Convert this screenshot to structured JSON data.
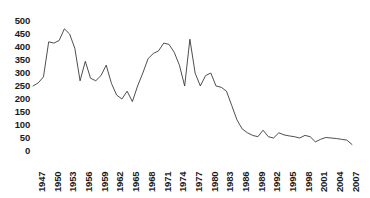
{
  "chart_data": {
    "type": "line",
    "title": "",
    "subtitle": "",
    "xlabel": "",
    "ylabel": "",
    "grid": false,
    "legend": null,
    "legend_position": "none",
    "line_color": "#3a3a3a",
    "xlim": [
      1947,
      2008
    ],
    "ylim": [
      0,
      500
    ],
    "ytick_labels": [
      "500",
      "450",
      "400",
      "350",
      "300",
      "250",
      "200",
      "150",
      "100",
      "50",
      "0"
    ],
    "ytick_values": [
      500,
      450,
      400,
      350,
      300,
      250,
      200,
      150,
      100,
      50,
      0
    ],
    "xtick_labels": [
      "1947",
      "1950",
      "1953",
      "1956",
      "1959",
      "1962",
      "1965",
      "1968",
      "1971",
      "1974",
      "1977",
      "1980",
      "1983",
      "1986",
      "1989",
      "1992",
      "1995",
      "1998",
      "2001",
      "2004",
      "2007"
    ],
    "xtick_values": [
      1947,
      1950,
      1953,
      1956,
      1959,
      1962,
      1965,
      1968,
      1971,
      1974,
      1977,
      1980,
      1983,
      1986,
      1989,
      1992,
      1995,
      1998,
      2001,
      2004,
      2007
    ],
    "x": [
      1947,
      1948,
      1949,
      1950,
      1951,
      1952,
      1953,
      1954,
      1955,
      1956,
      1957,
      1958,
      1959,
      1960,
      1961,
      1962,
      1963,
      1964,
      1965,
      1966,
      1967,
      1968,
      1969,
      1970,
      1971,
      1972,
      1973,
      1974,
      1975,
      1976,
      1977,
      1978,
      1979,
      1980,
      1981,
      1982,
      1983,
      1984,
      1985,
      1986,
      1987,
      1988,
      1989,
      1990,
      1991,
      1992,
      1993,
      1994,
      1995,
      1996,
      1997,
      1998,
      1999,
      2000,
      2001,
      2002,
      2003,
      2004,
      2005,
      2006,
      2007,
      2008
    ],
    "values": [
      250,
      262,
      285,
      420,
      415,
      425,
      470,
      450,
      395,
      270,
      345,
      280,
      270,
      290,
      330,
      260,
      215,
      200,
      230,
      190,
      250,
      300,
      355,
      375,
      385,
      415,
      410,
      380,
      330,
      250,
      430,
      300,
      250,
      290,
      300,
      250,
      245,
      230,
      175,
      120,
      85,
      70,
      60,
      55,
      80,
      55,
      50,
      70,
      62,
      58,
      55,
      50,
      60,
      55,
      35,
      45,
      52,
      50,
      48,
      45,
      42,
      25
    ],
    "series": [
      {
        "name": "series-1",
        "values": [
          250,
          262,
          285,
          420,
          415,
          425,
          470,
          450,
          395,
          270,
          345,
          280,
          270,
          290,
          330,
          260,
          215,
          200,
          230,
          190,
          250,
          300,
          355,
          375,
          385,
          415,
          410,
          380,
          330,
          250,
          430,
          300,
          250,
          290,
          300,
          250,
          245,
          230,
          175,
          120,
          85,
          70,
          60,
          55,
          80,
          55,
          50,
          70,
          62,
          58,
          55,
          50,
          60,
          55,
          35,
          45,
          52,
          50,
          48,
          45,
          42,
          25
        ]
      }
    ]
  }
}
